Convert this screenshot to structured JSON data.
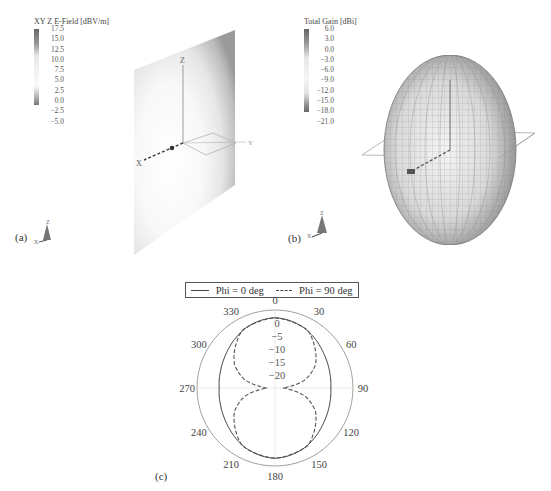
{
  "panel_a": {
    "label": "(a)",
    "colorbar": {
      "title": "XY Z E-Field [dBV/m]",
      "ticks": [
        "17.5",
        "15.0",
        "12.5",
        "10.0",
        "7.5",
        "5.0",
        "2.5",
        "0.0",
        "−2.5",
        "−5.0"
      ]
    },
    "axes_labels": {
      "z": "Z",
      "x": "X",
      "y": "Y"
    },
    "triad_labels": {
      "z": "Z",
      "x": "X"
    }
  },
  "panel_b": {
    "label": "(b)",
    "colorbar": {
      "title": "Total Gain [dBi]",
      "ticks": [
        "6.0",
        "3.0",
        "0.0",
        "−3.0",
        "−6.0",
        "−9.0",
        "−12.0",
        "−15.0",
        "−18.0",
        "−21.0"
      ]
    },
    "triad_labels": {
      "z": "Z",
      "x": "X"
    }
  },
  "panel_c": {
    "label": "(c)",
    "legend": [
      {
        "name": "Phi = 0 deg",
        "style": "solid"
      },
      {
        "name": "Phi = 90 deg",
        "style": "dashed"
      }
    ],
    "angle_labels": [
      "0",
      "30",
      "60",
      "90",
      "120",
      "150",
      "180",
      "210",
      "240",
      "270",
      "300",
      "330"
    ],
    "radial_labels": [
      "0",
      "−5",
      "−10",
      "−15",
      "−20"
    ]
  },
  "chart_data": [
    {
      "type": "heatmap",
      "title": "XY Z E-Field [dBV/m]",
      "colorbar_range": [
        -5.0,
        17.5
      ],
      "colorbar_ticks": [
        17.5,
        15.0,
        12.5,
        10.0,
        7.5,
        5.0,
        2.5,
        0.0,
        -2.5,
        -5.0
      ],
      "description": "E-field magnitude on a vertical plane with axes X, Y, Z"
    },
    {
      "type": "heatmap",
      "title": "Total Gain [dBi]",
      "colorbar_range": [
        -21.0,
        6.0
      ],
      "colorbar_ticks": [
        6.0,
        3.0,
        0.0,
        -3.0,
        -6.0,
        -9.0,
        -12.0,
        -15.0,
        -18.0,
        -21.0
      ],
      "description": "3D radiation pattern (oblate/egg shaped) with wireframe mesh"
    },
    {
      "type": "line",
      "subtype": "polar",
      "title": "",
      "theta_ticks": [
        0,
        30,
        60,
        90,
        120,
        150,
        180,
        210,
        240,
        270,
        300,
        330
      ],
      "r_ticks": [
        0,
        -5,
        -10,
        -15,
        -20
      ],
      "r_range": [
        -25,
        5
      ],
      "legend_position": "top",
      "series": [
        {
          "name": "Phi = 0 deg",
          "style": "solid",
          "theta": [
            0,
            30,
            60,
            90,
            120,
            150,
            180,
            210,
            240,
            270,
            300,
            330
          ],
          "values": [
            2.0,
            1.5,
            0.5,
            0.0,
            0.5,
            1.5,
            2.0,
            1.5,
            0.5,
            0.0,
            0.5,
            1.5
          ]
        },
        {
          "name": "Phi = 90 deg",
          "style": "dashed",
          "theta": [
            0,
            30,
            60,
            75,
            85,
            90,
            95,
            105,
            120,
            150,
            180,
            210,
            240,
            255,
            265,
            270,
            275,
            285,
            300,
            330
          ],
          "values": [
            2.0,
            0.5,
            -7.0,
            -13.0,
            -20.0,
            -22.0,
            -20.0,
            -13.0,
            -7.0,
            0.5,
            2.0,
            0.5,
            -7.0,
            -13.0,
            -20.0,
            -22.0,
            -20.0,
            -13.0,
            -7.0,
            0.5
          ]
        }
      ]
    }
  ]
}
